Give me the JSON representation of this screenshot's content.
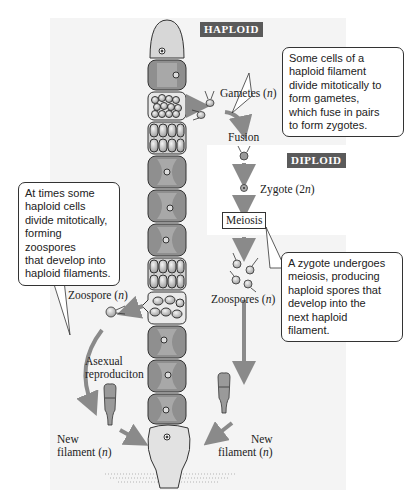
{
  "diagram": {
    "phases": {
      "haploid_label": "HAPLOID",
      "diploid_label": "DIPLOID"
    },
    "stages": {
      "gametes": {
        "text": "Gametes (",
        "ploidy": "n",
        "close": ")"
      },
      "fusion": "Fusion",
      "zygote": {
        "text": "Zygote (2",
        "ploidy": "n",
        "close": ")"
      },
      "meiosis": "Meiosis",
      "zoospores": {
        "text": "Zoospores (",
        "ploidy": "n",
        "close": ")"
      },
      "zoospore": {
        "text": "Zoospore (",
        "ploidy": "n",
        "close": ")"
      },
      "asexual_line1": "Asexual",
      "asexual_line2": "reproduciton",
      "new_filament_left": {
        "line1": "New",
        "line2": "filament (",
        "ploidy": "n",
        "close": ")"
      },
      "new_filament_right": {
        "line1": "New",
        "line2": "filament (",
        "ploidy": "n",
        "close": ")"
      }
    },
    "callouts": {
      "gametes_note": [
        "Some cells of a",
        "haploid filament",
        "divide mitotically to",
        "form gametes,",
        "which fuse in pairs",
        "to form zygotes."
      ],
      "zoospores_note": [
        "At times some",
        "haploid cells",
        "divide mitotically,",
        "forming zoospores",
        "that develop into",
        "haploid filaments."
      ],
      "meiosis_note": [
        "A zygote undergoes",
        "meiosis, producing",
        "haploid spores that",
        "develop into the",
        "next haploid",
        "filament."
      ]
    },
    "filament_cells": [
      "apical",
      "vegetative",
      "gametangium",
      "dividing",
      "vegetative",
      "vegetative",
      "vegetative",
      "dividing",
      "zoosporangium",
      "vegetative",
      "vegetative",
      "vegetative",
      "basal-holdfast"
    ],
    "colors": {
      "panel_bg": "#f4f4f4",
      "badge_bg": "#5a5a5a",
      "arrow": "#8a8a8a",
      "cell_fill": "#8f8f8f",
      "cell_light": "#d9d9d9"
    }
  }
}
